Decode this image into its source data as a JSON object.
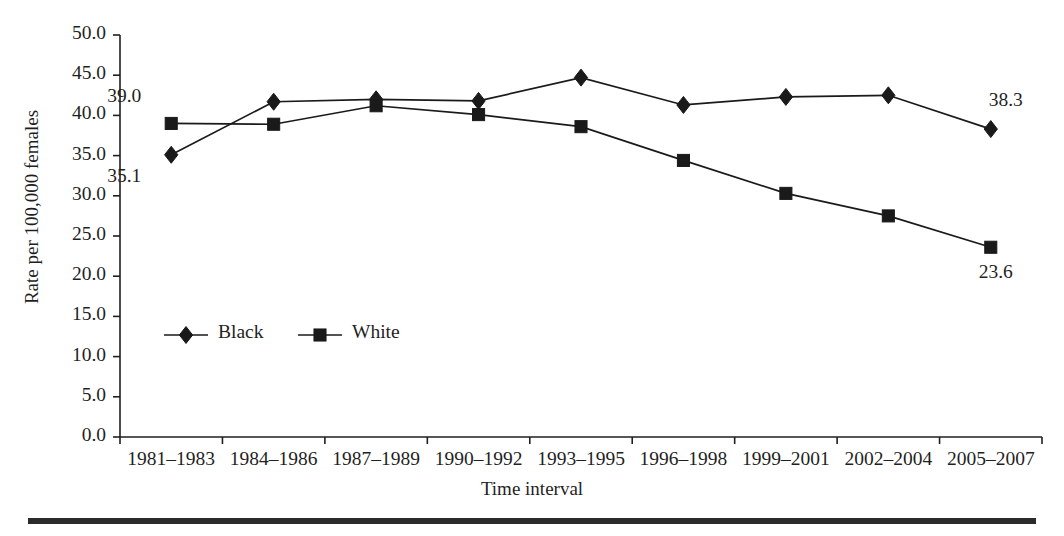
{
  "chart_data": {
    "type": "line",
    "title": "",
    "subtitle": "",
    "xlabel": "Time interval",
    "ylabel": "Rate per 100,000 females",
    "categories": [
      "1981–1983",
      "1984–1986",
      "1987–1989",
      "1990–1992",
      "1993–1995",
      "1996–1998",
      "1999–2001",
      "2002–2004",
      "2005–2007"
    ],
    "series": [
      {
        "name": "Black",
        "marker": "diamond",
        "color": "#1a1a1a",
        "values": [
          35.1,
          41.7,
          42.0,
          41.8,
          44.7,
          41.3,
          42.3,
          42.5,
          38.3
        ]
      },
      {
        "name": "White",
        "marker": "square",
        "color": "#1a1a1a",
        "values": [
          39.0,
          38.9,
          41.2,
          40.1,
          38.6,
          34.4,
          30.3,
          27.5,
          23.6
        ]
      }
    ],
    "ylim": [
      0.0,
      50.0
    ],
    "ytick_step": 5.0,
    "ytick_labels": [
      "0.0",
      "5.0",
      "10.0",
      "15.0",
      "20.0",
      "25.0",
      "30.0",
      "35.0",
      "40.0",
      "45.0",
      "50.0"
    ],
    "grid": false,
    "legend_position": "inside-lower-left",
    "annotations": [
      {
        "text": "39.0",
        "series": "White",
        "category": "1981–1983",
        "value": 39.0,
        "placement": "above-left"
      },
      {
        "text": "35.1",
        "series": "Black",
        "category": "1981–1983",
        "value": 35.1,
        "placement": "below-left"
      },
      {
        "text": "38.3",
        "series": "Black",
        "category": "2005–2007",
        "value": 38.3,
        "placement": "above-right"
      },
      {
        "text": "23.6",
        "series": "White",
        "category": "2005–2007",
        "value": 23.6,
        "placement": "below-right"
      }
    ]
  },
  "legend": {
    "entries": [
      {
        "label": "Black",
        "marker": "diamond"
      },
      {
        "label": "White",
        "marker": "square"
      }
    ]
  }
}
